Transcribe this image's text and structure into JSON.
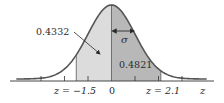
{
  "figure": {
    "colors": {
      "curve": "#555555",
      "axis": "#333333",
      "left_fill": "#dcdcdc",
      "right_fill": "#b8b8b8",
      "text": "#2a2a2a"
    },
    "areas": [
      {
        "label": "0.4332",
        "from_z": -1.5,
        "to_z": 0
      },
      {
        "label": "0.4821",
        "from_z": 0,
        "to_z": 2.1
      }
    ],
    "sigma_label": "σ",
    "axis_labels": {
      "left_bound": "z = −1.5",
      "center": "0",
      "right_bound": "z = 2.1",
      "axis_name": "z"
    },
    "ticks_z": [
      -3,
      -2,
      -1,
      0,
      1,
      2,
      3
    ]
  },
  "chart_data": {
    "type": "area",
    "title": "",
    "xlabel": "z",
    "ylabel": "",
    "distribution": "standard normal",
    "shaded_regions": [
      {
        "from": -1.5,
        "to": 0,
        "area": 0.4332
      },
      {
        "from": 0,
        "to": 2.1,
        "area": 0.4821
      }
    ],
    "x_ticks": [
      -3,
      -2,
      -1,
      0,
      1,
      2,
      3
    ],
    "labeled_points": [
      "z = −1.5",
      "0",
      "z = 2.1"
    ],
    "annotations": [
      "σ"
    ],
    "xlim": [
      -4,
      4
    ]
  }
}
